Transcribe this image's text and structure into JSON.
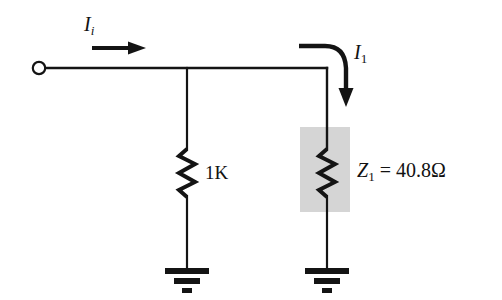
{
  "figure": {
    "background_color": "#ffffff",
    "wire_color": "#141414",
    "highlight_color": "#d4d4d4"
  },
  "labels": {
    "input_current": {
      "symbol": "I",
      "subscript": "i",
      "text": "Ii"
    },
    "branch_current": {
      "symbol": "I",
      "subscript": "1",
      "text": "I1"
    },
    "resistor_left": {
      "value": "1K",
      "text": "1K"
    },
    "impedance_right": {
      "symbol": "Z",
      "subscript": "1",
      "equals": "=",
      "value": "40.8",
      "unit": "Ω",
      "text": "Z1 = 40.8 Ω"
    }
  },
  "components": [
    {
      "name": "input-terminal",
      "type": "open-terminal",
      "x": 38,
      "y": 68
    },
    {
      "name": "node-junction",
      "type": "junction",
      "x": 187,
      "y": 68
    },
    {
      "name": "resistor-1k",
      "type": "resistor",
      "x": 187,
      "y_top": 148,
      "y_bottom": 198,
      "label": "1K"
    },
    {
      "name": "ground-left",
      "type": "ground",
      "x": 187,
      "y": 277
    },
    {
      "name": "resistor-z1",
      "type": "resistor",
      "x": 327,
      "y_top": 148,
      "y_bottom": 198,
      "label": "Z1 = 40.8 Ω"
    },
    {
      "name": "ground-right",
      "type": "ground",
      "x": 327,
      "y": 277
    },
    {
      "name": "highlight-box",
      "type": "shaded-region",
      "x": 300,
      "y": 127,
      "width": 50,
      "height": 85
    }
  ],
  "arrows": [
    {
      "name": "input-current-arrow",
      "type": "straight",
      "direction": "right",
      "x1": 92,
      "y1": 48,
      "x2": 140,
      "y2": 48
    },
    {
      "name": "branch-current-arrow",
      "type": "curved",
      "direction": "down",
      "start_x": 299,
      "start_y": 46,
      "end_x": 348,
      "end_y": 102
    }
  ]
}
